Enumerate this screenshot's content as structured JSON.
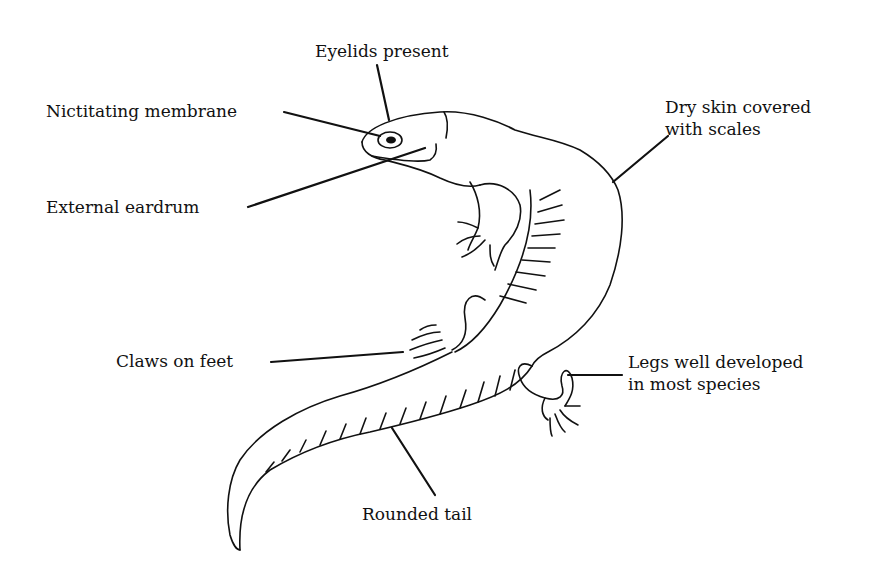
{
  "diagram": {
    "labels": {
      "eyelids": "Eyelids present",
      "nictitating": "Nictitating membrane",
      "eardrum": "External eardrum",
      "skin_line1": "Dry skin covered",
      "skin_line2": "with scales",
      "claws": "Claws on feet",
      "legs_line1": "Legs well developed",
      "legs_line2": "in most species",
      "tail": "Rounded tail"
    },
    "colors": {
      "ink": "#111111",
      "background": "#ffffff"
    }
  }
}
